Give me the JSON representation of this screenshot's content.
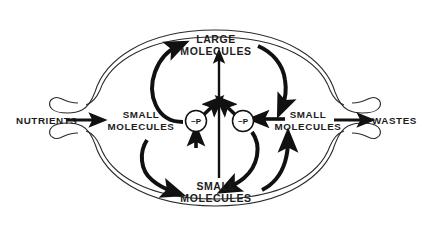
{
  "diagram": {
    "external_inputs": [
      {
        "id": "nutrients",
        "label": "NUTRIENTS",
        "side": "left"
      }
    ],
    "external_outputs": [
      {
        "id": "wastes",
        "label": "WASTES",
        "side": "right"
      }
    ],
    "nodes": [
      {
        "id": "large-molecules",
        "line1": "LARGE",
        "line2": "MOLECULES",
        "position": "top-center"
      },
      {
        "id": "small-molecules-left",
        "line1": "SMALL",
        "line2": "MOLECULES",
        "position": "middle-left"
      },
      {
        "id": "small-molecules-right",
        "line1": "SMALL",
        "line2": "MOLECULES",
        "position": "middle-right"
      },
      {
        "id": "small-molecules-bottom",
        "line1": "SMALL",
        "line2": "MOLECULES",
        "position": "bottom-center"
      },
      {
        "id": "energy-carrier-left",
        "label": "~P",
        "position": "center-left"
      },
      {
        "id": "energy-carrier-right",
        "label": "~P",
        "position": "center-right"
      }
    ],
    "membrane": {
      "name": "cell-membrane",
      "style": "double-line oval with two pore openings",
      "pores": [
        "left-pore",
        "right-pore"
      ]
    },
    "arrows": [
      {
        "id": "nutrients-in",
        "from": "NUTRIENTS",
        "to": "SMALL MOLECULES (left)",
        "kind": "straight"
      },
      {
        "id": "wastes-out",
        "from": "SMALL MOLECULES (right)",
        "to": "WASTES",
        "kind": "straight"
      },
      {
        "id": "left-up-to-large",
        "from": "~P (left)",
        "to": "LARGE MOLECULES",
        "kind": "curved"
      },
      {
        "id": "large-down-to-right",
        "from": "LARGE MOLECULES",
        "to": "SMALL MOLECULES (right)",
        "kind": "curved"
      },
      {
        "id": "left-down-to-bottom",
        "from": "SMALL MOLECULES (left)",
        "to": "SMALL MOLECULES (bottom)",
        "kind": "curved"
      },
      {
        "id": "bottom-up-to-right",
        "from": "SMALL MOLECULES (bottom)",
        "to": "SMALL MOLECULES (right)",
        "kind": "curved"
      },
      {
        "id": "right-to-p-right",
        "from": "SMALL MOLECULES (right)",
        "to": "~P (right)",
        "kind": "straight"
      },
      {
        "id": "p-right-down-to-bottom",
        "from": "~P (right)",
        "to": "SMALL MOLECULES (bottom)",
        "kind": "curved"
      },
      {
        "id": "bottom-center-up-to-large",
        "from": "SMALL MOLECULES (bottom)",
        "to": "LARGE MOLECULES",
        "kind": "straight-vertical"
      },
      {
        "id": "p-left-into-center",
        "from": "~P (left)",
        "to": "central vertical arrow",
        "kind": "diagonal"
      },
      {
        "id": "p-right-into-center",
        "from": "~P (right)",
        "to": "central vertical arrow",
        "kind": "diagonal"
      },
      {
        "id": "bottom-up-into-p-left",
        "from": "SMALL MOLECULES (bottom)",
        "to": "~P (left)",
        "kind": "diagonal"
      }
    ]
  },
  "colors": {
    "ink": "#111111",
    "membrane": "#2a2a2a",
    "background": "#ffffff"
  }
}
